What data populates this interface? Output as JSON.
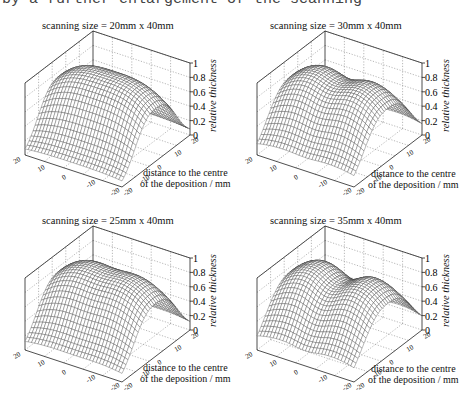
{
  "caption": "by a further enlargement of the scanning",
  "common": {
    "z_label": "relative thickness",
    "x_label_line1": "distance to the centre",
    "x_label_line2": "of the deposition / mm",
    "z_ticks": [
      "0",
      "0.2",
      "0.4",
      "0.6",
      "0.8",
      "1"
    ],
    "left_axis_ticks": [
      "20",
      "10",
      "0",
      "-10",
      "-20"
    ],
    "right_axis_ticks": [
      "20",
      "10",
      "0",
      "-10",
      "-20"
    ]
  },
  "chart_data": [
    {
      "type": "surface",
      "title": "scanning size = 20mm x 40mm",
      "xlabel": "distance to the centre of the deposition / mm",
      "zlabel": "relative thickness",
      "x_range": [
        -20,
        20
      ],
      "y_range": [
        -20,
        20
      ],
      "zlim": [
        0,
        1
      ],
      "z_ticks": [
        0,
        0.2,
        0.4,
        0.6,
        0.8,
        1
      ],
      "shape": "single ridge",
      "peak": 1.0,
      "edge_value_min": 0.15,
      "grid": true
    },
    {
      "type": "surface",
      "title": "scanning size = 30mm x 40mm",
      "xlabel": "distance to the centre of the deposition / mm",
      "zlabel": "relative thickness",
      "x_range": [
        -20,
        20
      ],
      "y_range": [
        -20,
        20
      ],
      "zlim": [
        0,
        1
      ],
      "z_ticks": [
        0,
        0.2,
        0.4,
        0.6,
        0.8,
        1
      ],
      "shape": "broad plateau, slight double hump",
      "peak": 0.98,
      "edge_value_min": 0.3,
      "grid": true
    },
    {
      "type": "surface",
      "title": "scanning size = 25mm x 40mm",
      "xlabel": "distance to the centre of the deposition / mm",
      "zlabel": "relative thickness",
      "x_range": [
        -20,
        20
      ],
      "y_range": [
        -20,
        20
      ],
      "zlim": [
        0,
        1
      ],
      "z_ticks": [
        0,
        0.2,
        0.4,
        0.6,
        0.8,
        1
      ],
      "shape": "ridge with flatter top",
      "peak": 1.0,
      "edge_value_min": 0.2,
      "grid": true
    },
    {
      "type": "surface",
      "title": "scanning size = 35mm x 40mm",
      "xlabel": "distance to the centre of the deposition / mm",
      "zlabel": "relative thickness",
      "x_range": [
        -20,
        20
      ],
      "y_range": [
        -20,
        20
      ],
      "zlim": [
        0,
        1
      ],
      "z_ticks": [
        0,
        0.2,
        0.4,
        0.6,
        0.8,
        1
      ],
      "shape": "double hump saddle",
      "peak": 0.95,
      "edge_value_min": 0.35,
      "grid": true
    }
  ],
  "panels": [
    {
      "title": "scanning size = 20mm x 40mm",
      "width_param": 0.55,
      "dip": 0.0
    },
    {
      "title": "scanning size = 30mm x 40mm",
      "width_param": 0.85,
      "dip": 0.12
    },
    {
      "title": "scanning size = 25mm x 40mm",
      "width_param": 0.7,
      "dip": 0.04
    },
    {
      "title": "scanning size = 35mm x 40mm",
      "width_param": 1.0,
      "dip": 0.2
    }
  ]
}
